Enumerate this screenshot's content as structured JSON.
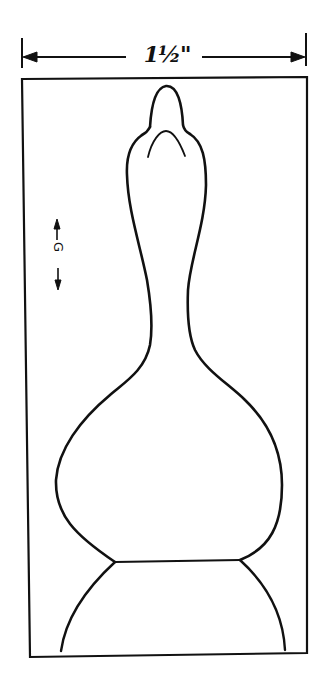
{
  "diagram": {
    "type": "carving-pattern",
    "dimension": {
      "label": "1½\"",
      "orientation": "horizontal"
    },
    "grain_marker": {
      "label": "G",
      "orientation": "vertical"
    },
    "colors": {
      "line": "#111111",
      "background": "#ffffff"
    }
  }
}
